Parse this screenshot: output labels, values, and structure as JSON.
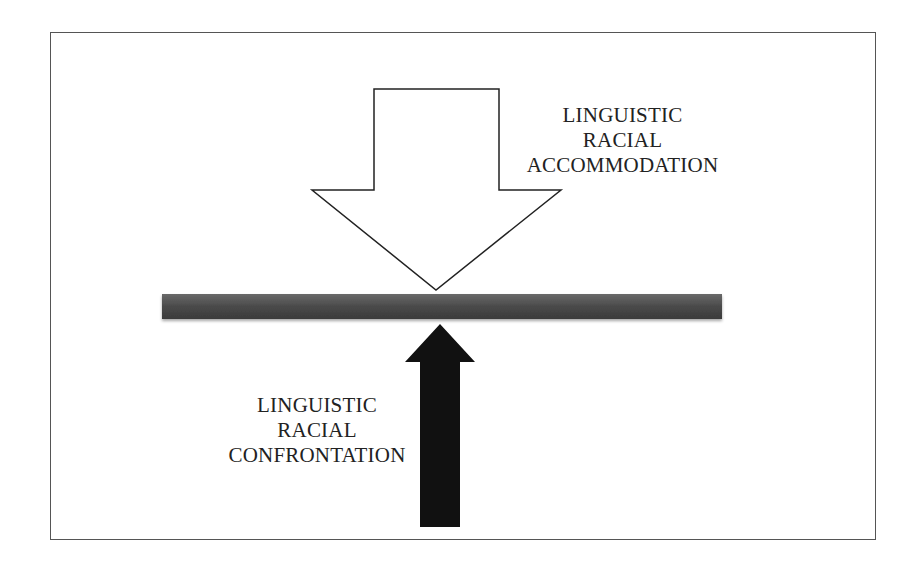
{
  "diagram": {
    "frame": {
      "border_color": "#555555"
    },
    "down_arrow": {
      "fill": "#ffffff",
      "stroke": "#222222",
      "label_lines": [
        "LINGUISTIC",
        "RACIAL",
        "ACCOMMODATION"
      ]
    },
    "barrier": {
      "fill": "#4a4a4a"
    },
    "up_arrow": {
      "fill": "#111111",
      "label_lines": [
        "LINGUISTIC",
        "RACIAL",
        "CONFRONTATION"
      ]
    }
  }
}
